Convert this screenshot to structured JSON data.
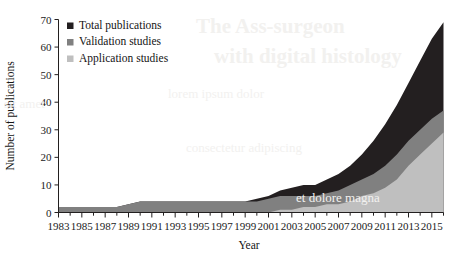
{
  "chart_data": {
    "type": "area",
    "stacked": true,
    "title": "",
    "xlabel": "Year",
    "ylabel": "Number of publications",
    "xlim": [
      1983,
      2016
    ],
    "ylim": [
      0,
      70
    ],
    "yticks": [
      0,
      10,
      20,
      30,
      40,
      50,
      60,
      70
    ],
    "xticks": [
      1983,
      1985,
      1987,
      1989,
      1991,
      1993,
      1995,
      1997,
      1999,
      2001,
      2003,
      2005,
      2007,
      2009,
      2011,
      2013,
      2015
    ],
    "xticks_minor_step": 1,
    "grid": false,
    "legend_position": "top-left",
    "x": [
      1983,
      1984,
      1985,
      1986,
      1987,
      1988,
      1989,
      1990,
      1991,
      1992,
      1993,
      1994,
      1995,
      1996,
      1997,
      1998,
      1999,
      2000,
      2001,
      2002,
      2003,
      2004,
      2005,
      2006,
      2007,
      2008,
      2009,
      2010,
      2011,
      2012,
      2013,
      2014,
      2015,
      2016
    ],
    "series": [
      {
        "name": "Total publications",
        "color": "#231f20",
        "values": [
          2,
          2,
          2,
          2,
          2,
          2,
          3,
          4,
          4,
          4,
          4,
          4,
          4,
          4,
          4,
          4,
          4,
          5,
          6,
          8,
          9,
          10,
          10,
          12,
          14,
          17,
          21,
          26,
          32,
          39,
          47,
          55,
          63,
          69
        ]
      },
      {
        "name": "Validation studies",
        "color": "#808080",
        "values": [
          2,
          2,
          2,
          2,
          2,
          2,
          3,
          4,
          4,
          4,
          4,
          4,
          4,
          4,
          4,
          4,
          4,
          4,
          5,
          6,
          6,
          6,
          6,
          7,
          8,
          10,
          12,
          14,
          17,
          21,
          26,
          30,
          34,
          37
        ]
      },
      {
        "name": "Application studies",
        "color": "#bfbfbf",
        "values": [
          0,
          0,
          0,
          0,
          0,
          0,
          0,
          0,
          0,
          0,
          0,
          0,
          0,
          0,
          0,
          0,
          0,
          0,
          0,
          1,
          1,
          2,
          2,
          3,
          3,
          4,
          6,
          7,
          9,
          12,
          17,
          21,
          25,
          29
        ]
      }
    ]
  },
  "legend": {
    "items": [
      {
        "label": "Total publications",
        "color": "#231f20"
      },
      {
        "label": "Validation studies",
        "color": "#808080"
      },
      {
        "label": "Application studies",
        "color": "#bfbfbf"
      }
    ]
  },
  "background_text": {
    "line1": "The Ass-surgeon",
    "line2": "with digital histology",
    "line3": "lorem ipsum dolor",
    "line4": "consectetur adipiscing",
    "line5": "sit amet",
    "line6": "et dolore magna"
  }
}
